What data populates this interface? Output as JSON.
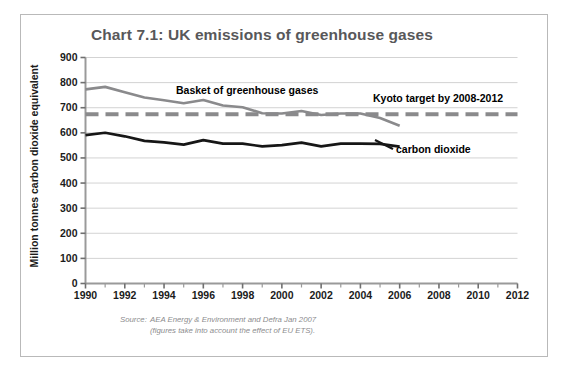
{
  "figure": {
    "title": "Chart 7.1: UK emissions of greenhouse gases",
    "source_label": "Source:",
    "source_line1": "AEA Energy & Environment and Defra Jan 2007",
    "source_line2": "(figures take into account the effect of EU ETS).",
    "border_color": "#b9b9b9",
    "title_color": "#58585a"
  },
  "annotations": {
    "basket": "Basket of greenhouse gases",
    "kyoto": "Kyoto target by 2008-2012",
    "carbon_dioxide": "carbon dioxide"
  },
  "chart_data": {
    "type": "line",
    "title": "Chart 7.1: UK emissions of greenhouse gases",
    "xlabel": "",
    "ylabel": "Million tonnes carbon dioxide equivalent",
    "xlim": [
      1990,
      2012
    ],
    "ylim": [
      0,
      900
    ],
    "grid": "horizontal",
    "legend": "inline-annotations",
    "ytick_labels": [
      "0",
      "100",
      "200",
      "300",
      "400",
      "500",
      "600",
      "700",
      "800",
      "900"
    ],
    "ytick_values": [
      0,
      100,
      200,
      300,
      400,
      500,
      600,
      700,
      800,
      900
    ],
    "xtick_labels": [
      "1990",
      "1992",
      "1994",
      "1996",
      "1998",
      "2000",
      "2002",
      "2004",
      "2006",
      "2008",
      "2010",
      "2012"
    ],
    "xtick_values": [
      1990,
      1992,
      1994,
      1996,
      1998,
      2000,
      2002,
      2004,
      2006,
      2008,
      2010,
      2012
    ],
    "x_minor_values": [
      1991,
      1993,
      1995,
      1997,
      1999,
      2001,
      2003,
      2005,
      2007,
      2009,
      2011
    ],
    "series": [
      {
        "name": "Basket of greenhouse gases",
        "color": "#8a8a8c",
        "width": 2.6,
        "style": "solid",
        "x": [
          1990,
          1991,
          1992,
          1993,
          1994,
          1995,
          1996,
          1997,
          1998,
          1999,
          2000,
          2001,
          2002,
          2003,
          2004,
          2005,
          2006
        ],
        "values": [
          773,
          783,
          762,
          741,
          730,
          718,
          731,
          709,
          702,
          678,
          677,
          687,
          671,
          677,
          677,
          659,
          628
        ]
      },
      {
        "name": "carbon dioxide",
        "color": "#161616",
        "width": 2.6,
        "style": "solid",
        "x": [
          1990,
          1991,
          1992,
          1993,
          1994,
          1995,
          1996,
          1997,
          1998,
          1999,
          2000,
          2001,
          2002,
          2003,
          2004,
          2005,
          2006
        ],
        "values": [
          591,
          600,
          586,
          568,
          562,
          553,
          571,
          557,
          557,
          546,
          551,
          561,
          546,
          557,
          557,
          556,
          545
        ]
      },
      {
        "name": "Kyoto target by 2008-2012",
        "color": "#8a8a8c",
        "width": 4.0,
        "style": "dashed",
        "x": [
          1990,
          2012
        ],
        "values": [
          674,
          674
        ]
      }
    ]
  }
}
